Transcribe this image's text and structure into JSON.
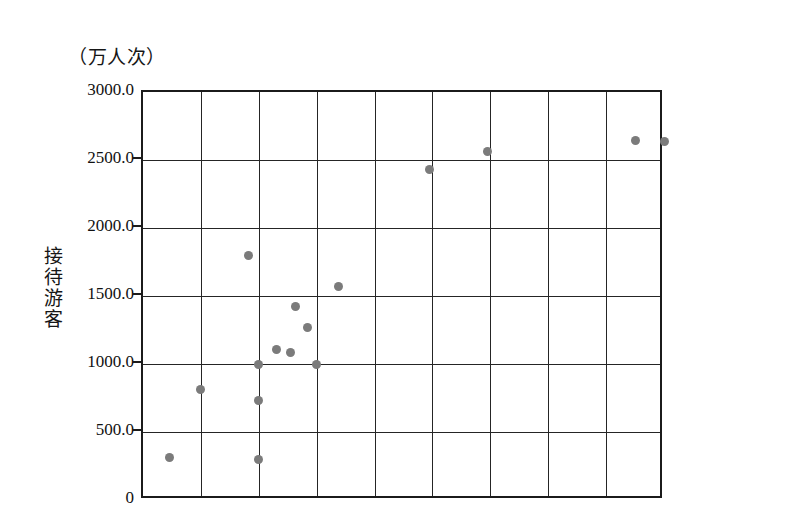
{
  "chart_data": {
    "type": "scatter",
    "title": "",
    "unit_caption": "（万人次）",
    "ylabel": "接待游客",
    "xlabel": "",
    "ylim": [
      0,
      3000
    ],
    "y_ticks": [
      "0",
      "500.0",
      "1000.0",
      "1500.0",
      "2000.0",
      "2500.0",
      "3000.0"
    ],
    "y_tick_values": [
      0,
      500,
      1000,
      1500,
      2000,
      2500,
      3000
    ],
    "x_ticks": [],
    "xlim": [
      0,
      9
    ],
    "x_gridline_count": 9,
    "grid": true,
    "legend": "none",
    "marker_color": "#7b7b7b",
    "axis_color": "#1b1b1b",
    "points": [
      {
        "x": 0.45,
        "y": 310
      },
      {
        "x": 1.0,
        "y": 810
      },
      {
        "x": 2.0,
        "y": 300
      },
      {
        "x": 2.0,
        "y": 735
      },
      {
        "x": 1.82,
        "y": 1800
      },
      {
        "x": 2.0,
        "y": 1000
      },
      {
        "x": 2.3,
        "y": 1105
      },
      {
        "x": 2.55,
        "y": 1085
      },
      {
        "x": 2.63,
        "y": 1425
      },
      {
        "x": 2.85,
        "y": 1270
      },
      {
        "x": 3.0,
        "y": 1000
      },
      {
        "x": 3.38,
        "y": 1570
      },
      {
        "x": 4.95,
        "y": 2430
      },
      {
        "x": 5.95,
        "y": 2560
      },
      {
        "x": 8.5,
        "y": 2640
      },
      {
        "x": 9.0,
        "y": 2635
      }
    ]
  }
}
